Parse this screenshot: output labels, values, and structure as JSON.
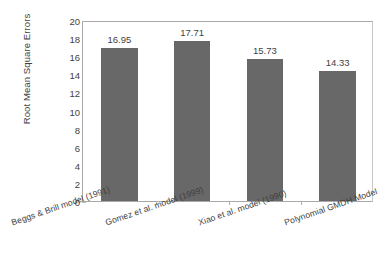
{
  "chart_data": {
    "type": "bar",
    "title": "",
    "xlabel": "",
    "ylabel": "Root Mean Square Errors",
    "categories": [
      "Beggs & Brill model (1991)",
      "Gomez et al. model (1999)",
      "Xiao et al. model (1990)",
      "Polynomial GMDH Model"
    ],
    "values": [
      16.95,
      17.71,
      15.73,
      14.33
    ],
    "value_labels": [
      "16.95",
      "17.71",
      "15.73",
      "14.33"
    ],
    "ylim": [
      0,
      20
    ],
    "ytick_step": 2,
    "ytick_labels": [
      "0",
      "2",
      "4",
      "6",
      "8",
      "10",
      "12",
      "14",
      "16",
      "18",
      "20"
    ],
    "grid": false,
    "legend": false,
    "legend_position": "none",
    "bar_color": "#686868",
    "axis_color": "#a9a9a9",
    "text_color": "#3f3f3f",
    "background_color": "#ffffff"
  }
}
